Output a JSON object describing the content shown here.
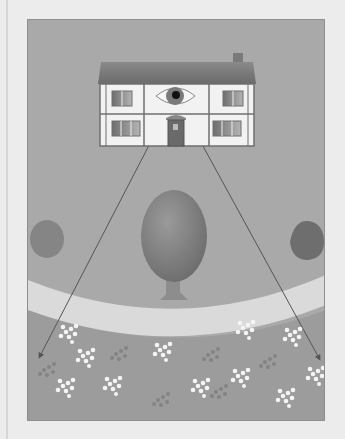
{
  "illustration": {
    "description": "Grayscale illustration of a two-storey house with an eye in the upper-middle facade; two sight lines radiate down across a tree, curved path and flower meadow",
    "colors": {
      "page_background": "#ececec",
      "panel_background": "#a9a9a9",
      "roof": "#777777",
      "house_wall": "#f2f2f2",
      "timber_frame": "#6f6f6f",
      "window": "#8a8a8a",
      "door": "#6a6a6a",
      "eye_iris": "#7a7a7a",
      "eye_pupil": "#111111",
      "tree_canopy": "#808080",
      "tree_trunk": "#8c8c8c",
      "path": "#d9d9d9",
      "meadow": "#9a9a9a",
      "flower_light": "#f4f4f4",
      "flower_dark": "#858585",
      "sight_line": "#555555"
    },
    "elements": [
      "house",
      "chimney",
      "eye",
      "door",
      "windows",
      "central-tree",
      "left-bush",
      "right-bush",
      "curved-path",
      "flower-meadow",
      "left-sight-line",
      "right-sight-line"
    ]
  }
}
